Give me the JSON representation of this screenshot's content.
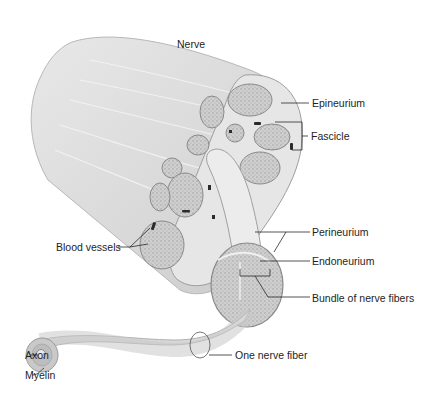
{
  "diagram": {
    "title": "Nerve",
    "labels": {
      "nerve": "Nerve",
      "epineurium": "Epineurium",
      "fascicle": "Fascicle",
      "blood_vessels": "Blood vessels",
      "perineurium": "Perineurium",
      "endoneurium": "Endoneurium",
      "bundle": "Bundle of nerve fibers",
      "one_fiber": "One nerve fiber",
      "axon": "Axon",
      "myelin": "Myelin"
    },
    "colors": {
      "background": "#ffffff",
      "text": "#1e1e1e",
      "leader_line": "#2a2a2a",
      "nerve_body": "#dcdcdc",
      "nerve_shadow": "#c4c4c4",
      "fascicle_fill": "#d2d2d2",
      "fascicle_stroke": "#8a8a8a",
      "blood_vessel": "#2b2b2b"
    }
  }
}
